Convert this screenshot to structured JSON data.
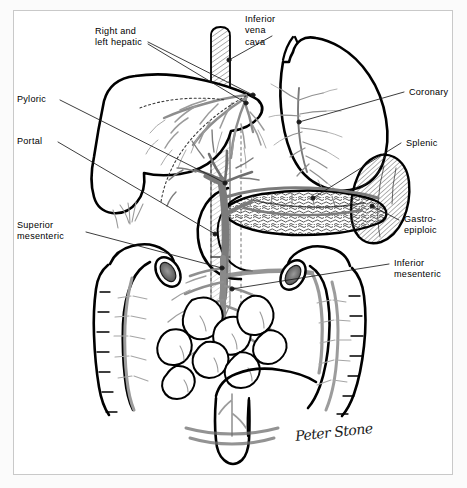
{
  "figure": {
    "signature": "Peter Stone",
    "border_color": "#c9c9c9",
    "ink_color": "#000000",
    "vessel_color": "#8a8a8a",
    "background": "#ffffff"
  },
  "labels": {
    "right_and_left_hepatic": "Right and\nleft hepatic",
    "inferior_vena_cava": "Inferior\nvena\ncava",
    "pyloric": "Pyloric",
    "portal": "Portal",
    "superior_mesenteric": "Superior\nmesenteric",
    "coronary": "Coronary",
    "splenic": "Splenic",
    "gastro_epiploic": "Gastro-\nepiploic",
    "inferior_mesenteric": "Inferior\nmesenteric"
  },
  "structures": [
    "liver",
    "stomach",
    "spleen",
    "pancreas",
    "duodenum",
    "inferior vena cava",
    "portal vein",
    "superior mesenteric vein",
    "inferior mesenteric vein",
    "splenic vein",
    "coronary vein",
    "gastro-epiploic vein",
    "pyloric vein",
    "ascending colon",
    "transverse colon",
    "descending colon",
    "sigmoid colon",
    "rectum",
    "small bowel loops"
  ]
}
